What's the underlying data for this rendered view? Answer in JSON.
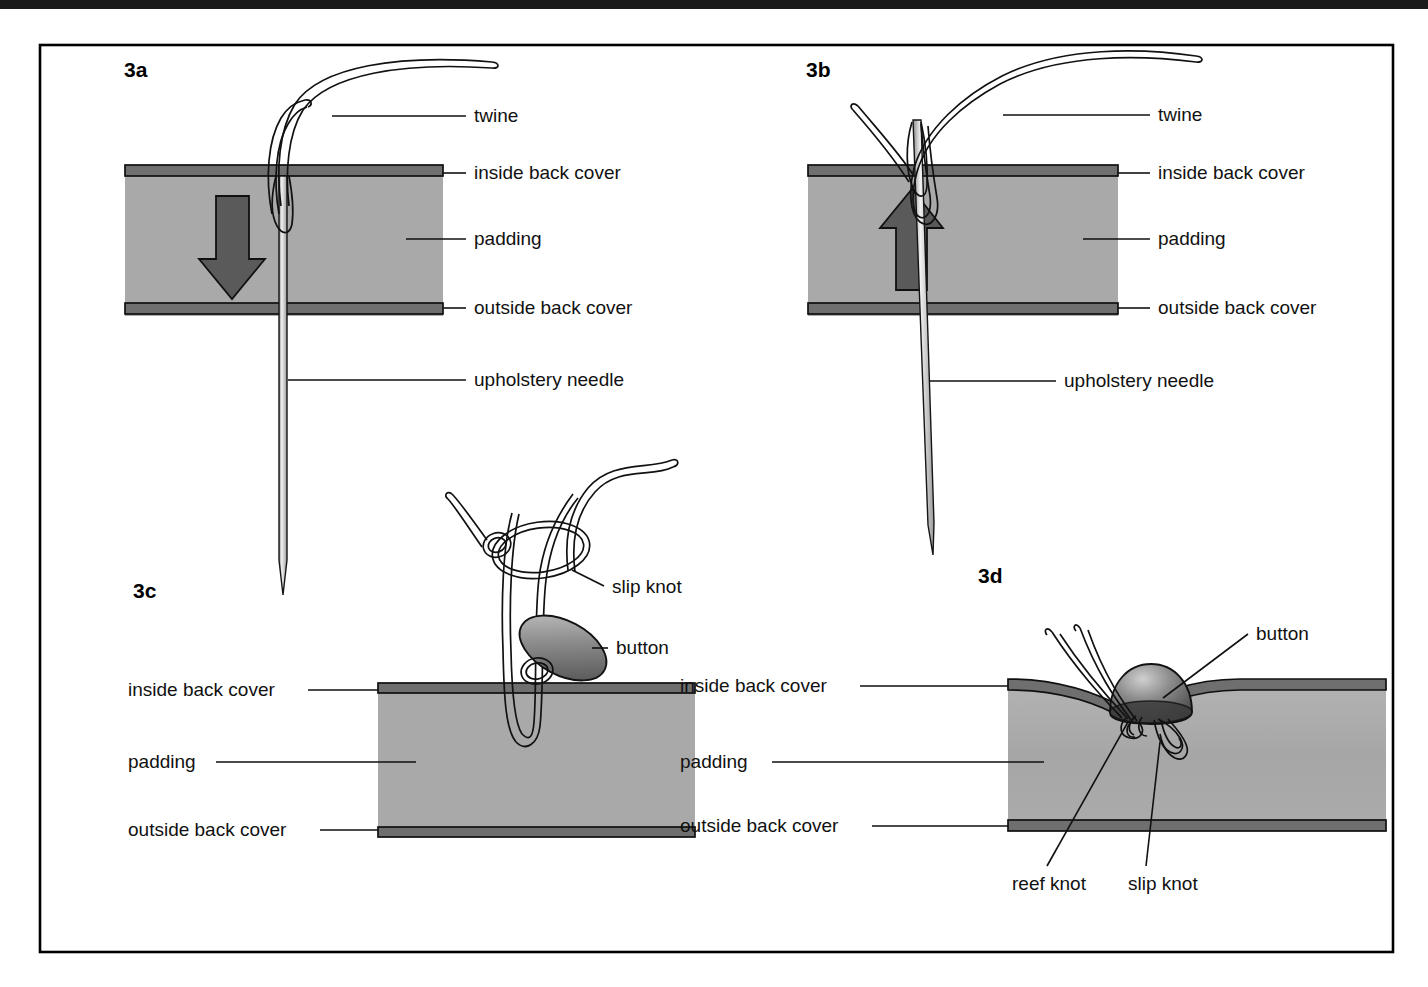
{
  "figure": {
    "title_visible": false,
    "background": "#ffffff",
    "frame_color": "#000000"
  },
  "colors": {
    "padding_fill": "#a9a9a9",
    "cover_fill": "#6f6f6f",
    "arrow_fill": "#5a5a5a",
    "twine_outline": "#111111",
    "button_dark": "#4a4a4a",
    "button_light": "#c9c9c9"
  },
  "panels": [
    {
      "id": "3a",
      "id_label": "3a",
      "description": "Needle pushed down through inside back cover, padding and outside back cover",
      "arrow_direction": "down",
      "labels": [
        {
          "key": "twine",
          "text": "twine"
        },
        {
          "key": "inside_back_cover",
          "text": "inside back cover"
        },
        {
          "key": "padding",
          "text": "padding"
        },
        {
          "key": "outside_back_cover",
          "text": "outside back cover"
        },
        {
          "key": "upholstery_needle",
          "text": "upholstery needle"
        }
      ]
    },
    {
      "id": "3b",
      "id_label": "3b",
      "description": "Needle pulled back up through the covers leaving a loop of twine",
      "arrow_direction": "up",
      "labels": [
        {
          "key": "twine",
          "text": "twine"
        },
        {
          "key": "inside_back_cover",
          "text": "inside back cover"
        },
        {
          "key": "padding",
          "text": "padding"
        },
        {
          "key": "outside_back_cover",
          "text": "outside back cover"
        },
        {
          "key": "upholstery_needle",
          "text": "upholstery needle"
        }
      ]
    },
    {
      "id": "3c",
      "id_label": "3c",
      "description": "Button threaded on the twine loop with a slip knot above it",
      "arrow_direction": "none",
      "labels": [
        {
          "key": "slip_knot",
          "text": "slip knot"
        },
        {
          "key": "button",
          "text": "button"
        },
        {
          "key": "inside_back_cover",
          "text": "inside back cover"
        },
        {
          "key": "padding",
          "text": "padding"
        },
        {
          "key": "outside_back_cover",
          "text": "outside back cover"
        }
      ]
    },
    {
      "id": "3d",
      "id_label": "3d",
      "description": "Button pulled down into the padding, secured with reef knot and slip knot",
      "arrow_direction": "none",
      "labels": [
        {
          "key": "button",
          "text": "button"
        },
        {
          "key": "inside_back_cover",
          "text": "inside back cover"
        },
        {
          "key": "padding",
          "text": "padding"
        },
        {
          "key": "outside_back_cover",
          "text": "outside back cover"
        },
        {
          "key": "reef_knot",
          "text": "reef knot"
        },
        {
          "key": "slip_knot",
          "text": "slip knot"
        }
      ]
    }
  ]
}
